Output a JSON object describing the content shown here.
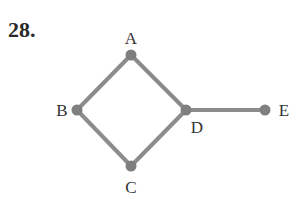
{
  "problem": {
    "number": "28."
  },
  "graph": {
    "edge_color": "#8c8c8c",
    "node_color": "#7f7f7f",
    "label_color": "#333333",
    "nodes": [
      {
        "id": "A",
        "label": "A",
        "x": 131,
        "y": 55,
        "lx": 131,
        "ly": 44,
        "anchor": "middle"
      },
      {
        "id": "B",
        "label": "B",
        "x": 77,
        "y": 110,
        "lx": 62,
        "ly": 116,
        "anchor": "middle"
      },
      {
        "id": "C",
        "label": "C",
        "x": 131,
        "y": 166,
        "lx": 131,
        "ly": 193,
        "anchor": "middle"
      },
      {
        "id": "D",
        "label": "D",
        "x": 186,
        "y": 110,
        "lx": 197,
        "ly": 133,
        "anchor": "middle"
      },
      {
        "id": "E",
        "label": "E",
        "x": 265,
        "y": 110,
        "lx": 284,
        "ly": 116,
        "anchor": "middle"
      }
    ],
    "edges": [
      {
        "from": "A",
        "to": "B"
      },
      {
        "from": "A",
        "to": "D"
      },
      {
        "from": "B",
        "to": "C"
      },
      {
        "from": "C",
        "to": "D"
      },
      {
        "from": "D",
        "to": "E"
      }
    ]
  }
}
